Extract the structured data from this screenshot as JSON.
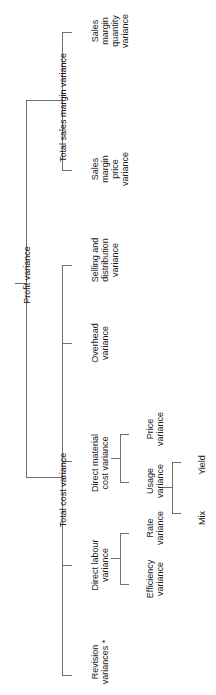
{
  "diagram": {
    "orientation": "rotated-90-ccw",
    "line_color": "#6f6f6f",
    "text_color": "#1a1a1a",
    "background": "#ffffff",
    "footnote_marker": "*"
  },
  "nodes": {
    "root": {
      "label": "Profit variance",
      "lines": [
        "Profit variance"
      ]
    },
    "total_sales_margin_variance": {
      "label": "Total sales margin variance",
      "lines": [
        "Total sales margin variance"
      ]
    },
    "total_cost_variance": {
      "label": "Total cost variance",
      "lines": [
        "Total cost variance"
      ]
    },
    "sales_margin_quantity_variance": {
      "label": "Sales margin quantity variance",
      "lines": [
        "Sales",
        "margin",
        "quantity",
        "variance"
      ]
    },
    "sales_margin_price_variance": {
      "label": "Sales margin price variance",
      "lines": [
        "Sales",
        "margin",
        "price",
        "variance"
      ]
    },
    "selling_and_distribution_variance": {
      "label": "Selling and distribution variance",
      "lines": [
        "Selling and",
        "distribution",
        "variance"
      ]
    },
    "overhead_variance": {
      "label": "Overhead variance",
      "lines": [
        "Overhead",
        "variance"
      ]
    },
    "direct_material_cost_variance": {
      "label": "Direct material cost variance",
      "lines": [
        "Direct material",
        "cost variance"
      ]
    },
    "direct_labour_variance": {
      "label": "Direct labour variance",
      "lines": [
        "Direct labour",
        "variance"
      ]
    },
    "revision_variances": {
      "label": "Revision variances *",
      "lines": [
        "Revision",
        "variances *"
      ]
    },
    "price_variance": {
      "label": "Price variance",
      "lines": [
        "Price",
        "variance"
      ]
    },
    "usage_variance": {
      "label": "Usage variance",
      "lines": [
        "Usage",
        "variance"
      ]
    },
    "rate_variance": {
      "label": "Rate variance",
      "lines": [
        "Rate",
        "variance"
      ]
    },
    "efficiency_variance": {
      "label": "Efficiency variance",
      "lines": [
        "Efficiency",
        "variance"
      ]
    },
    "yield_node": {
      "label": "Yield",
      "lines": [
        "Yield"
      ]
    },
    "mix_node": {
      "label": "Mix",
      "lines": [
        "Mix"
      ]
    }
  },
  "hierarchy": [
    {
      "id": "root",
      "name": "Profit variance",
      "children": [
        {
          "id": "total_sales_margin_variance",
          "name": "Total sales margin variance",
          "children": [
            {
              "id": "sales_margin_quantity_variance",
              "name": "Sales margin quantity variance"
            },
            {
              "id": "sales_margin_price_variance",
              "name": "Sales margin price variance"
            }
          ]
        },
        {
          "id": "total_cost_variance",
          "name": "Total cost variance",
          "children": [
            {
              "id": "selling_and_distribution_variance",
              "name": "Selling and distribution variance"
            },
            {
              "id": "overhead_variance",
              "name": "Overhead variance"
            },
            {
              "id": "direct_material_cost_variance",
              "name": "Direct material cost variance",
              "children": [
                {
                  "id": "price_variance",
                  "name": "Price variance"
                },
                {
                  "id": "usage_variance",
                  "name": "Usage variance",
                  "children": [
                    {
                      "id": "yield_node",
                      "name": "Yield"
                    },
                    {
                      "id": "mix_node",
                      "name": "Mix"
                    }
                  ]
                }
              ]
            },
            {
              "id": "direct_labour_variance",
              "name": "Direct labour variance",
              "children": [
                {
                  "id": "rate_variance",
                  "name": "Rate variance"
                },
                {
                  "id": "efficiency_variance",
                  "name": "Efficiency variance"
                }
              ]
            },
            {
              "id": "revision_variances",
              "name": "Revision variances *"
            }
          ]
        }
      ]
    }
  ]
}
